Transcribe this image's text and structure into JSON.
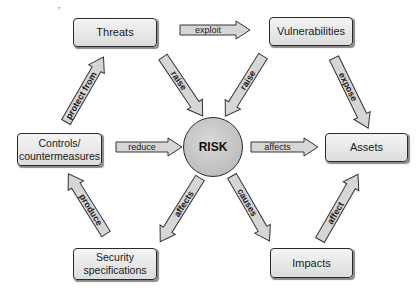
{
  "diagram": {
    "center": {
      "label": "RISK"
    },
    "nodes": {
      "threats": {
        "label": "Threats"
      },
      "vulnerabilities": {
        "label": "Vulnerabilities"
      },
      "controls": {
        "label": "Controls/\ncountermeasures"
      },
      "assets": {
        "label": "Assets"
      },
      "security_specifications": {
        "label": "Security\nspecifications"
      },
      "impacts": {
        "label": "Impacts"
      }
    },
    "edges": [
      {
        "id": "exploit",
        "from": "Threats",
        "to": "Vulnerabilities",
        "label": "exploit"
      },
      {
        "id": "raise-threats",
        "from": "Threats",
        "to": "RISK",
        "label": "raise"
      },
      {
        "id": "raise-vulns",
        "from": "Vulnerabilities",
        "to": "RISK",
        "label": "raise"
      },
      {
        "id": "expose",
        "from": "Vulnerabilities",
        "to": "Assets",
        "label": "expose"
      },
      {
        "id": "protect-from",
        "from": "Controls/countermeasures",
        "to": "Threats",
        "label": "protect from"
      },
      {
        "id": "reduce",
        "from": "Controls/countermeasures",
        "to": "RISK",
        "label": "reduce"
      },
      {
        "id": "affects-assets",
        "from": "RISK",
        "to": "Assets",
        "label": "affects"
      },
      {
        "id": "affects-specs",
        "from": "RISK",
        "to": "Security specifications",
        "label": "affects"
      },
      {
        "id": "causes",
        "from": "RISK",
        "to": "Impacts",
        "label": "causes"
      },
      {
        "id": "produce",
        "from": "Security specifications",
        "to": "Controls/countermeasures",
        "label": "produce"
      },
      {
        "id": "affect",
        "from": "Impacts",
        "to": "Assets",
        "label": "affect"
      }
    ]
  },
  "colors": {
    "node_fill": "#e6e6e6",
    "risk_fill": "#c4c4c4",
    "arrow_fill": "#d6d6d6",
    "stroke": "#2a2a2a"
  }
}
